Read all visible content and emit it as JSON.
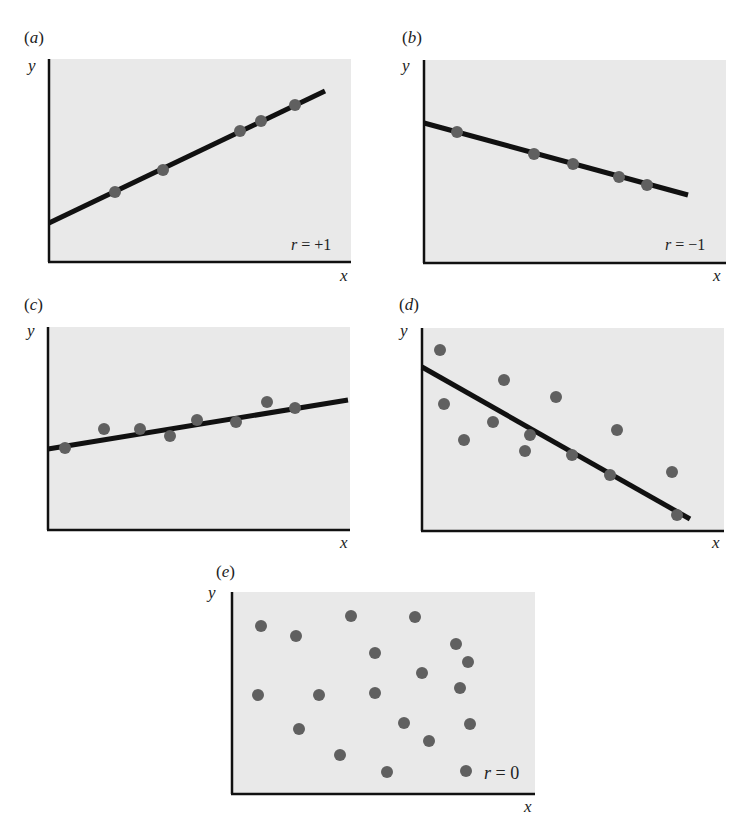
{
  "figure": {
    "background": "#ffffff",
    "plot_background": "#e9e9e9",
    "axis_color": "#111111",
    "line_color": "#111111",
    "dot_color": "#606060",
    "axis_x_label": "x",
    "axis_y_label": "y"
  },
  "panels": [
    {
      "id": "a",
      "label": "a",
      "r_label": "= +1",
      "r_symbol": "r"
    },
    {
      "id": "b",
      "label": "b",
      "r_label": "= −1",
      "r_symbol": "r"
    },
    {
      "id": "c",
      "label": "c",
      "r_label": "",
      "r_symbol": ""
    },
    {
      "id": "d",
      "label": "d",
      "r_label": "",
      "r_symbol": ""
    },
    {
      "id": "e",
      "label": "e",
      "r_label": "= 0",
      "r_symbol": "r"
    }
  ],
  "chart_data": [
    {
      "type": "scatter",
      "title": "(a)",
      "xlabel": "x",
      "ylabel": "y",
      "annotation": "r = +1",
      "plot_size": [
        302,
        202
      ],
      "regression_line": [
        [
          0,
          164
        ],
        [
          276,
          32
        ]
      ],
      "points": [
        [
          66,
          133
        ],
        [
          114,
          111
        ],
        [
          191,
          72
        ],
        [
          212,
          62
        ],
        [
          246,
          46
        ]
      ],
      "grid": false
    },
    {
      "type": "scatter",
      "title": "(b)",
      "xlabel": "x",
      "ylabel": "y",
      "annotation": "r = −1",
      "plot_size": [
        302,
        202
      ],
      "regression_line": [
        [
          0,
          63
        ],
        [
          264,
          135
        ]
      ],
      "points": [
        [
          33,
          72
        ],
        [
          110,
          94
        ],
        [
          149,
          104
        ],
        [
          195,
          117
        ],
        [
          223,
          125
        ]
      ],
      "grid": false
    },
    {
      "type": "scatter",
      "title": "(c)",
      "xlabel": "x",
      "ylabel": "y",
      "annotation": "",
      "plot_size": [
        302,
        202
      ],
      "regression_line": [
        [
          0,
          122
        ],
        [
          300,
          73
        ]
      ],
      "points": [
        [
          17,
          121
        ],
        [
          56,
          102
        ],
        [
          92,
          102
        ],
        [
          122,
          109
        ],
        [
          149,
          93
        ],
        [
          188,
          95
        ],
        [
          219,
          75
        ],
        [
          247,
          81
        ]
      ],
      "grid": false
    },
    {
      "type": "scatter",
      "title": "(d)",
      "xlabel": "x",
      "ylabel": "y",
      "annotation": "",
      "plot_size": [
        302,
        202
      ],
      "regression_line": [
        [
          0,
          39
        ],
        [
          268,
          191
        ]
      ],
      "points": [
        [
          18,
          22
        ],
        [
          22,
          76
        ],
        [
          42,
          112
        ],
        [
          82,
          52
        ],
        [
          71,
          94
        ],
        [
          134,
          69
        ],
        [
          108,
          107
        ],
        [
          103,
          123
        ],
        [
          150,
          127
        ],
        [
          195,
          102
        ],
        [
          188,
          147
        ],
        [
          250,
          144
        ],
        [
          255,
          187
        ]
      ],
      "grid": false
    },
    {
      "type": "scatter",
      "title": "(e)",
      "xlabel": "x",
      "ylabel": "y",
      "annotation": "r = 0",
      "plot_size": [
        303,
        201
      ],
      "regression_line": null,
      "points": [
        [
          29,
          34
        ],
        [
          64,
          44
        ],
        [
          119,
          24
        ],
        [
          183,
          25
        ],
        [
          143,
          61
        ],
        [
          224,
          52
        ],
        [
          236,
          70
        ],
        [
          190,
          81
        ],
        [
          228,
          96
        ],
        [
          26,
          103
        ],
        [
          87,
          103
        ],
        [
          143,
          101
        ],
        [
          67,
          137
        ],
        [
          172,
          131
        ],
        [
          238,
          132
        ],
        [
          197,
          149
        ],
        [
          108,
          163
        ],
        [
          155,
          180
        ],
        [
          234,
          179
        ]
      ],
      "grid": false
    }
  ]
}
